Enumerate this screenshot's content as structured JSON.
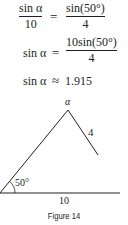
{
  "equations": [
    {
      "lhs_num": "sin α",
      "lhs_den": "10",
      "op": "=",
      "rhs_num": "sin(50°)",
      "rhs_den": "4"
    },
    {
      "lhs": "sin α",
      "op": "=",
      "rhs_num": "10sin(50°)",
      "rhs_den": "4"
    },
    {
      "lhs": "sin α",
      "op": "≈",
      "rhs": "1.915"
    }
  ],
  "figure": {
    "apex_label": "α",
    "side_label": "4",
    "angle_label": "50°",
    "base_label": "10",
    "caption": "Figure 14",
    "line_color": "#231f20"
  }
}
